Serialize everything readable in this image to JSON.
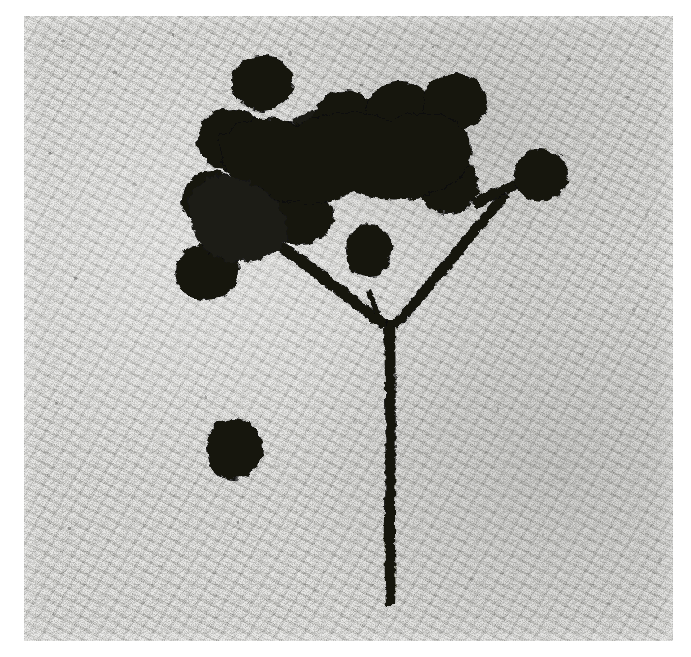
{
  "image": {
    "kind": "photograph",
    "subject": "dried plant stem with berry cluster",
    "background_subject": "speckled granite stone slab",
    "color_mode": "black-and-white",
    "canvas_width": 691,
    "canvas_height": 657,
    "border_color": "#ffffff",
    "plate": {
      "left": 24,
      "top": 16,
      "width": 649,
      "height": 625
    },
    "palette": {
      "paper_white": "#ffffff",
      "stone_light": "#d9d9d6",
      "stone_mid": "#8c8c89",
      "stone_dark": "#6b6b68",
      "specimen_black": "#121210"
    }
  },
  "specimen": {
    "name": "branched stem bearing a cluster of round berries",
    "main_stem": {
      "name": "main-stem",
      "description": "single thick vertical stalk running from the fork down to the lower edge",
      "top": 325,
      "bottom": 605,
      "x": 388,
      "thickness": 8
    },
    "fork": {
      "name": "stem-fork",
      "x": 390,
      "y": 325
    },
    "branches": [
      {
        "name": "left-branch",
        "from": [
          390,
          322
        ],
        "to": [
          246,
          214
        ]
      },
      {
        "name": "right-branch",
        "from": [
          392,
          322
        ],
        "to": [
          500,
          176
        ]
      },
      {
        "name": "upper-right-twig",
        "from": [
          470,
          198
        ],
        "to": [
          540,
          168
        ]
      },
      {
        "name": "left-upper-twig",
        "from": [
          300,
          225
        ],
        "to": [
          262,
          140
        ]
      }
    ],
    "berries": [
      {
        "name": "berry-top",
        "cx": 262,
        "cy": 82,
        "rx": 30,
        "ry": 27
      },
      {
        "name": "berry-upper-left",
        "cx": 232,
        "cy": 140,
        "rx": 34,
        "ry": 30
      },
      {
        "name": "berry-left-mid",
        "cx": 213,
        "cy": 200,
        "rx": 30,
        "ry": 28
      },
      {
        "name": "berry-lower-left",
        "cx": 207,
        "cy": 272,
        "rx": 31,
        "ry": 27
      },
      {
        "name": "berry-center-left",
        "cx": 290,
        "cy": 155,
        "rx": 36,
        "ry": 32
      },
      {
        "name": "berry-center",
        "cx": 300,
        "cy": 215,
        "rx": 33,
        "ry": 29
      },
      {
        "name": "berry-center-upper",
        "cx": 345,
        "cy": 120,
        "rx": 32,
        "ry": 28
      },
      {
        "name": "berry-mid-right",
        "cx": 400,
        "cy": 112,
        "rx": 33,
        "ry": 29
      },
      {
        "name": "berry-right-upper",
        "cx": 455,
        "cy": 102,
        "rx": 31,
        "ry": 28
      },
      {
        "name": "berry-right",
        "cx": 448,
        "cy": 185,
        "rx": 30,
        "ry": 28
      },
      {
        "name": "berry-far-right",
        "cx": 541,
        "cy": 175,
        "rx": 26,
        "ry": 25
      },
      {
        "name": "berry-small-middle",
        "cx": 369,
        "cy": 250,
        "rx": 22,
        "ry": 25
      },
      {
        "name": "berry-detached",
        "cx": 234,
        "cy": 449,
        "rx": 28,
        "ry": 31
      }
    ],
    "detached_berry": {
      "name": "detached-berry",
      "description": "single isolated round berry lying alone in the lower-left area",
      "cx": 234,
      "cy": 449
    },
    "counts": {
      "berries_on_cluster": 12,
      "detached_berries": 1,
      "total_berries": 13
    }
  }
}
